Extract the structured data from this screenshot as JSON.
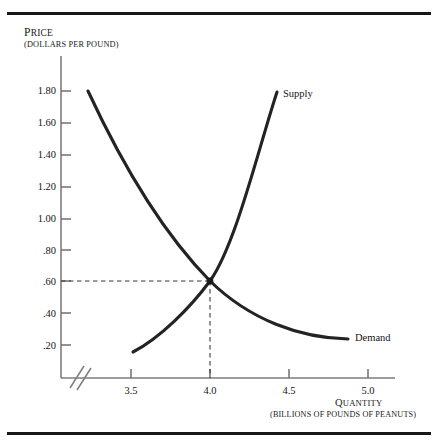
{
  "figure": {
    "price_axis": {
      "title": "PRICE",
      "units": "(DOLLARS PER POUND)"
    },
    "quantity_axis": {
      "title": "QUANTITY",
      "units": "(BILLIONS OF POUNDS OF PEANUTS)"
    },
    "curve_labels": {
      "supply": "Supply",
      "demand": "Demand"
    }
  },
  "chart_data": {
    "type": "line",
    "title": "",
    "xlabel": "QUANTITY (BILLIONS OF POUNDS OF PEANUTS)",
    "ylabel": "PRICE (DOLLARS PER POUND)",
    "xlim": [
      3.2,
      5.2
    ],
    "ylim": [
      0.0,
      1.95
    ],
    "grid": false,
    "legend_position": "inline-at-curve-ends",
    "xticks": [
      "3.5",
      "4.0",
      "4.5",
      "5.0"
    ],
    "xtick_values": [
      3.5,
      4.0,
      4.5,
      5.0
    ],
    "yticks": [
      "1.80",
      "1.60",
      "1.40",
      "1.20",
      "1.00",
      ".80",
      ".60",
      ".40",
      ".20"
    ],
    "ytick_values": [
      1.8,
      1.6,
      1.4,
      1.2,
      1.0,
      0.8,
      0.6,
      0.4,
      0.2
    ],
    "axis_break": "x-axis broken between origin and 3.5",
    "equilibrium": {
      "quantity": 4.0,
      "price": 0.6,
      "marker": "dot",
      "guide_lines": "dashed to both axes"
    },
    "series": [
      {
        "name": "Demand",
        "downward_sloping": true,
        "points": [
          {
            "q": 3.55,
            "p": 1.8
          },
          {
            "q": 3.65,
            "p": 1.45
          },
          {
            "q": 3.75,
            "p": 1.13
          },
          {
            "q": 3.85,
            "p": 0.88
          },
          {
            "q": 4.0,
            "p": 0.6
          },
          {
            "q": 4.2,
            "p": 0.42
          },
          {
            "q": 4.45,
            "p": 0.3
          },
          {
            "q": 4.75,
            "p": 0.24
          },
          {
            "q": 5.1,
            "p": 0.22
          }
        ]
      },
      {
        "name": "Supply",
        "upward_sloping": true,
        "points": [
          {
            "q": 3.58,
            "p": 0.155
          },
          {
            "q": 3.7,
            "p": 0.25
          },
          {
            "q": 3.82,
            "p": 0.38
          },
          {
            "q": 3.92,
            "p": 0.5
          },
          {
            "q": 4.0,
            "p": 0.6
          },
          {
            "q": 4.12,
            "p": 0.83
          },
          {
            "q": 4.26,
            "p": 1.18
          },
          {
            "q": 4.38,
            "p": 1.52
          },
          {
            "q": 4.48,
            "p": 1.86
          }
        ]
      }
    ]
  }
}
